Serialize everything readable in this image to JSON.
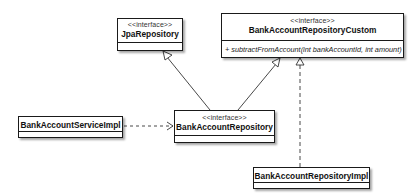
{
  "diagram": {
    "type": "UML class diagram",
    "classes": {
      "jpa_repository": {
        "stereotype": "<<interface>>",
        "name": "JpaRepository",
        "operations": []
      },
      "repository_custom": {
        "stereotype": "<<interface>>",
        "name": "BankAccountRepositoryCustom",
        "operations": [
          "+ subtractFromAccount(int bankAccountId, int amount)"
        ]
      },
      "service_impl": {
        "stereotype": "",
        "name": "BankAccountServiceImpl",
        "operations": []
      },
      "repository": {
        "stereotype": "<<interface>>",
        "name": "BankAccountRepository",
        "operations": []
      },
      "repository_impl": {
        "stereotype": "",
        "name": "BankAccountRepositoryImpl",
        "operations": []
      }
    },
    "relationships": [
      {
        "from": "BankAccountRepository",
        "to": "JpaRepository",
        "kind": "generalization"
      },
      {
        "from": "BankAccountRepository",
        "to": "BankAccountRepositoryCustom",
        "kind": "generalization"
      },
      {
        "from": "BankAccountRepositoryImpl",
        "to": "BankAccountRepositoryCustom",
        "kind": "realization"
      },
      {
        "from": "BankAccountServiceImpl",
        "to": "BankAccountRepository",
        "kind": "dependency"
      }
    ]
  }
}
